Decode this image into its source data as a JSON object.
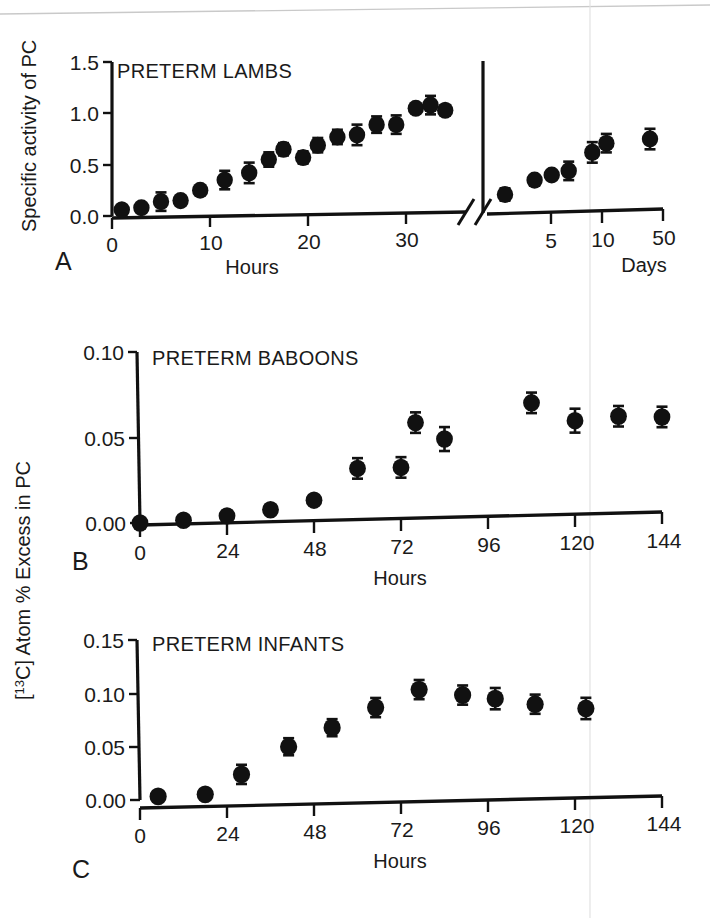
{
  "figure": {
    "background": "#ffffff",
    "ink_color": "#111111",
    "scan_artifacts": {
      "top_streak": true,
      "vertical_fold_x": 590
    }
  },
  "panels": [
    {
      "id": "A",
      "letter": "A",
      "title": "PRETERM LAMBS",
      "ylabel": "Specific activity of PC",
      "xlabel_left": "Hours",
      "xlabel_right": "Days",
      "broken_axis": true,
      "y_ticks": [
        "0.0",
        "0.5",
        "1.0",
        "1.5"
      ],
      "x_ticks_left": [
        "0",
        "10",
        "20",
        "30"
      ],
      "x_ticks_right": [
        "5",
        "10",
        "50"
      ]
    },
    {
      "id": "B",
      "letter": "B",
      "title": "PRETERM BABOONS",
      "xlabel": "Hours",
      "y_ticks": [
        "0.00",
        "0.05",
        "0.10"
      ],
      "x_ticks": [
        "0",
        "24",
        "48",
        "72",
        "96",
        "120",
        "144"
      ]
    },
    {
      "id": "C",
      "letter": "C",
      "title": "PRETERM INFANTS",
      "xlabel": "Hours",
      "y_ticks": [
        "0.00",
        "0.05",
        "0.10",
        "0.15"
      ],
      "x_ticks": [
        "0",
        "24",
        "48",
        "72",
        "96",
        "120",
        "144"
      ]
    }
  ],
  "shared_ylabel": {
    "prefix": "[",
    "superscript": "13",
    "element": "C] Atom % Excess in PC",
    "full": "[13C] Atom % Excess in PC"
  },
  "chart_data": [
    {
      "type": "scatter",
      "panel": "A",
      "title": "PRETERM LAMBS",
      "xlabel": "Hours",
      "xlabel_secondary": "Days",
      "ylabel": "Specific activity of PC",
      "ylim": [
        0.0,
        1.5
      ],
      "yticks": [
        0.0,
        0.5,
        1.0,
        1.5
      ],
      "grid": false,
      "legend": "none",
      "axis_break": true,
      "segments": [
        {
          "name": "hours",
          "xlabel": "Hours",
          "xlim": [
            0,
            36
          ],
          "xticks": [
            0,
            10,
            20,
            30
          ],
          "x": [
            1,
            3,
            5,
            7,
            9,
            11.5,
            14,
            16,
            17.5,
            19.5,
            21,
            23,
            25,
            27,
            29,
            31,
            32.5,
            34
          ],
          "y": [
            0.06,
            0.08,
            0.14,
            0.15,
            0.25,
            0.35,
            0.42,
            0.55,
            0.65,
            0.57,
            0.69,
            0.77,
            0.79,
            0.89,
            0.89,
            1.05,
            1.08,
            1.03
          ],
          "yerr": [
            0.04,
            0.03,
            0.09,
            0.02,
            0.02,
            0.09,
            0.1,
            0.07,
            0.06,
            0.06,
            0.07,
            0.07,
            0.1,
            0.08,
            0.09,
            0.02,
            0.09,
            0.05
          ]
        },
        {
          "name": "days",
          "xlabel": "Days",
          "xticks_labels": [
            5,
            10,
            50
          ],
          "x": [
            2,
            3.2,
            4.2,
            5.5,
            8,
            10,
            20
          ],
          "y": [
            0.19,
            0.33,
            0.38,
            0.42,
            0.6,
            0.69,
            0.73
          ],
          "yerr": [
            0.06,
            0.02,
            0.02,
            0.09,
            0.1,
            0.09,
            0.1
          ]
        }
      ]
    },
    {
      "type": "scatter",
      "panel": "B",
      "title": "PRETERM BABOONS",
      "xlabel": "Hours",
      "ylabel": "[13C] Atom % Excess in PC",
      "xlim": [
        0,
        144
      ],
      "ylim": [
        0.0,
        0.1
      ],
      "xticks": [
        0,
        24,
        48,
        72,
        96,
        120,
        144
      ],
      "yticks": [
        0.0,
        0.05,
        0.1
      ],
      "grid": false,
      "legend": "none",
      "x": [
        0,
        12,
        24,
        36,
        48,
        60,
        72,
        76,
        84,
        108,
        120,
        132,
        144
      ],
      "y": [
        0.0,
        0.001,
        0.003,
        0.006,
        0.011,
        0.029,
        0.029,
        0.055,
        0.045,
        0.065,
        0.054,
        0.056,
        0.055
      ],
      "yerr": [
        0.0,
        0.0,
        0.0,
        0.0,
        0.0,
        0.006,
        0.006,
        0.006,
        0.007,
        0.006,
        0.007,
        0.006,
        0.006
      ]
    },
    {
      "type": "scatter",
      "panel": "C",
      "title": "PRETERM INFANTS",
      "xlabel": "Hours",
      "ylabel": "[13C] Atom % Excess in PC",
      "xlim": [
        0,
        144
      ],
      "ylim": [
        0.0,
        0.15
      ],
      "xticks": [
        0,
        24,
        48,
        72,
        96,
        120,
        144
      ],
      "yticks": [
        0.0,
        0.05,
        0.1,
        0.15
      ],
      "grid": false,
      "legend": "none",
      "x": [
        5,
        18,
        28,
        41,
        53,
        65,
        77,
        89,
        98,
        109,
        123
      ],
      "y": [
        0.003,
        0.004,
        0.022,
        0.047,
        0.064,
        0.082,
        0.098,
        0.092,
        0.088,
        0.082,
        0.077
      ],
      "yerr": [
        0.0,
        0.0,
        0.009,
        0.008,
        0.008,
        0.009,
        0.009,
        0.009,
        0.01,
        0.009,
        0.01
      ]
    }
  ]
}
